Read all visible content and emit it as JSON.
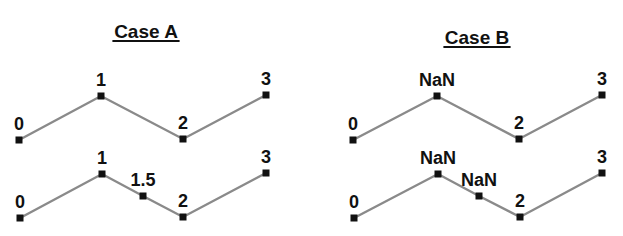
{
  "panels": [
    {
      "title": "Case A",
      "title_pos": [
        146,
        38
      ],
      "rows": [
        {
          "points": [
            {
              "label": "0",
              "x": 19,
              "y": 140
            },
            {
              "label": "1",
              "x": 101,
              "y": 96
            },
            {
              "label": "2",
              "x": 183,
              "y": 139
            },
            {
              "label": "3",
              "x": 266,
              "y": 95
            }
          ]
        },
        {
          "points": [
            {
              "label": "0",
              "x": 20,
              "y": 218
            },
            {
              "label": "1",
              "x": 102,
              "y": 174
            },
            {
              "label": "1.5",
              "x": 143,
              "y": 196
            },
            {
              "label": "2",
              "x": 183,
              "y": 217
            },
            {
              "label": "3",
              "x": 266,
              "y": 173
            }
          ]
        }
      ]
    },
    {
      "title": "Case B",
      "title_pos": [
        477,
        44
      ],
      "rows": [
        {
          "points": [
            {
              "label": "0",
              "x": 353,
              "y": 140
            },
            {
              "label": "NaN",
              "x": 437,
              "y": 96
            },
            {
              "label": "2",
              "x": 519,
              "y": 139
            },
            {
              "label": "3",
              "x": 602,
              "y": 95
            }
          ]
        },
        {
          "points": [
            {
              "label": "0",
              "x": 354,
              "y": 218
            },
            {
              "label": "NaN",
              "x": 438,
              "y": 174
            },
            {
              "label": "NaN",
              "x": 479,
              "y": 196
            },
            {
              "label": "2",
              "x": 520,
              "y": 217
            },
            {
              "label": "3",
              "x": 602,
              "y": 173
            }
          ]
        }
      ]
    }
  ],
  "colors": {
    "line": "#8a8a8a",
    "point": "#111111",
    "text": "#111111"
  }
}
